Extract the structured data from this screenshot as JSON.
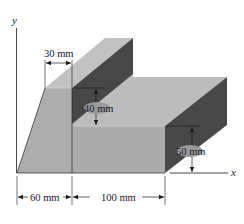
{
  "figure": {
    "axes": {
      "x_label": "x",
      "y_label": "y"
    },
    "dimensions": {
      "top_width": "30 mm",
      "step_height": "40 mm",
      "front_height": "50 mm",
      "left_base": "60 mm",
      "right_base": "100 mm"
    },
    "colors": {
      "light_face": "#b5b5b5",
      "mid_face": "#a9a9a9",
      "dark_face": "#4a4a4a",
      "top_face": "#bdbdbd",
      "label_bubble": "#9a9a9a"
    }
  }
}
